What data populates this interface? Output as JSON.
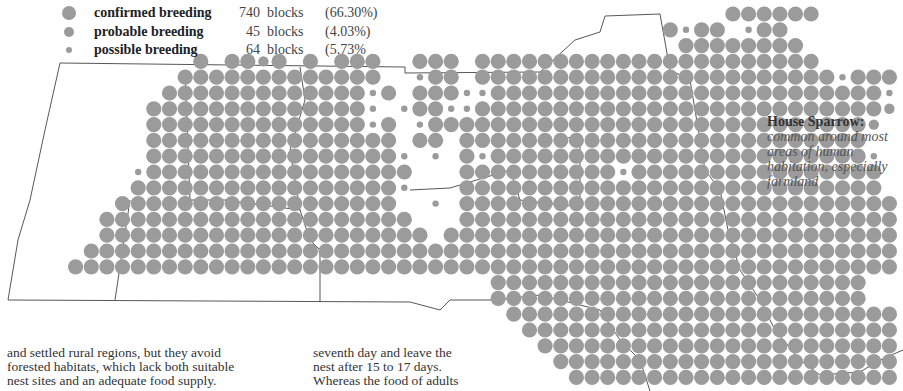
{
  "legend": {
    "items": [
      {
        "label": "confirmed breeding",
        "count": "740",
        "unit": "blocks",
        "percent": "(66.30%)",
        "dot_size": 14
      },
      {
        "label": "probable breeding",
        "count": "45",
        "unit": "blocks",
        "percent": "(4.03%)",
        "dot_size": 10
      },
      {
        "label": "possible breeding",
        "count": "64",
        "unit": "blocks",
        "percent": "(5.73%",
        "dot_size": 6
      }
    ]
  },
  "caption": {
    "title": "House Sparrow:",
    "description": "common around most areas of human habitation, especially farmland"
  },
  "text": {
    "left_lines": [
      "and settled rural regions, but they avoid",
      "forested habitats, which lack both suitable",
      "nest sites and an adequate food supply."
    ],
    "mid_lines": [
      "seventh day and leave the",
      "nest after 15 to 17 days.",
      "Whereas the food of adults"
    ]
  },
  "map": {
    "dot_color": "#9b9b9b",
    "border_color": "#444444",
    "grid": {
      "x0": 13,
      "dx": 15.65,
      "y0": 14,
      "dy": 15.8
    },
    "radius": {
      "C": 7.6,
      "P": 5.2,
      "S": 3.2
    },
    "rows": [
      "..............................................CCCCCC.........",
      "..........................................CSCC.SCC...........",
      "...........................................CCCCCCCC..........",
      "............C.CCPC.C.CCC..CCC.CCCCCCCCCCCCCCCCCCCCCC.........",
      "...........CCCCCCCCCCCCC..SCC.CCCCCCCCCCCCCCCCCCCCCCCSCCC....",
      "..........CCCCCCCCCCCCCSC.CCCSSCCCCCCCCCCCCCCCCCCCCCCCCCS...",
      ".........CCCCCCCCCCCCCCS.SCCSSCCCCCCCCCCCCCCCCCCCCCCCCCCP....",
      ".........CCCCCCCCCCCCCCSC.SCCCCCCCCCCCCCCCCCCCCCCCCCCCCP......",
      ".........CCCCCCCCCCCCCCCC.CC.CCCCCCCCCCCCCCCCCCCCCCCCCC.......",
      ".........CCCCCCCCCCCCCCCCS.S.CSCCCCCCCCCCCCCCCCCCCCCCCCS......",
      "........SCCCCCCCCCCCCCCCCC...CCCCCCCCCCSCCCCCCCCCCCCCCCC.....",
      "........CCCCCCCCCCCCCCCCCS...CCCCCCCCCCCCCCCCCCCCCCCCCCC.....",
      ".......CCCCCCCCCCCCCCCCCC..S.CCCCCCCCCCCCCCCCCCCCCCCCCCCC.....",
      "......CCCCCCCCCCCCCCCCCCCC...CCCCCCCCCCCCCCCCCCCCCCCCCCCCC....",
      "......CCCCCCCCCCCCCCCCCCCCC.CCCCCCCCCCCCCCCCCCCCCCCCCCCCCC...",
      ".....CCCCCCCCCCCCCCCCCCCCCCCCCCCCCCCCCCCCCCCCCCCCCCCCCCCCCC..",
      "....CCCCCCCCCCCCCCCCCCCCCCCCCCCCCCCCCCCCCCCCCCCCCCCCCCCCCCCCC",
      "...............................CCCCCCCCCCCCCCCCCCCCCCCC......",
      "...............................CCCCCCCCCCCCCCCCCCCCCCCC......",
      "................................CCCCCCCCCCCCCCCCCCCCCCCCC....",
      ".................................CCCCCCCCCCCCCCCCCCCCCCCCCCC.",
      "..................................CCCCCCCCCCCCCCCCCCCCCCCCC.",
      "...................................CCCCCCCCCCCCCCCCCCCCCCC..",
      "....................................CCCCCCCCCCCCCCCCCCCCCC.."
    ]
  }
}
